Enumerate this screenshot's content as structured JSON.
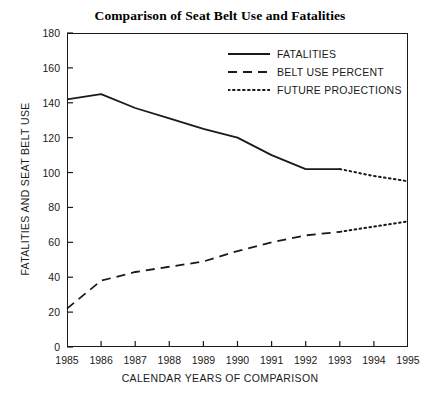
{
  "chart_data": {
    "type": "line",
    "title": "Comparison of Seat Belt Use and Fatalities",
    "xlabel": "CALENDAR YEARS OF COMPARISON",
    "ylabel": "FATALITIES AND SEAT BELT USE",
    "grid": false,
    "legend_position": "top-right",
    "x": [
      1985,
      1986,
      1987,
      1988,
      1989,
      1990,
      1991,
      1992,
      1993,
      1994,
      1995
    ],
    "xlim": [
      1985,
      1995
    ],
    "ylim": [
      0,
      180
    ],
    "xticks": [
      "1985",
      "1986",
      "1987",
      "1988",
      "1989",
      "1990",
      "1991",
      "1992",
      "1993",
      "1994",
      "1995"
    ],
    "yticks": [
      "0",
      "20",
      "40",
      "60",
      "80",
      "100",
      "120",
      "140",
      "160",
      "180"
    ],
    "series": [
      {
        "name": "FATALITIES",
        "style": "solid",
        "color": "#1a1a1a",
        "x": [
          1985,
          1986,
          1987,
          1988,
          1989,
          1990,
          1991,
          1992,
          1993
        ],
        "values": [
          142,
          145,
          137,
          131,
          125,
          120,
          110,
          102,
          102
        ]
      },
      {
        "name": "BELT USE PERCENT",
        "style": "dashed",
        "color": "#1a1a1a",
        "x": [
          1985,
          1986,
          1987,
          1988,
          1989,
          1990,
          1991,
          1992,
          1993
        ],
        "values": [
          22,
          38,
          43,
          46,
          49,
          55,
          60,
          64,
          66
        ]
      },
      {
        "name": "FUTURE PROJECTIONS",
        "style": "dotted",
        "color": "#1a1a1a",
        "segments": [
          {
            "x": [
              1993,
              1994,
              1995
            ],
            "values": [
              102,
              98,
              95
            ]
          },
          {
            "x": [
              1993,
              1994,
              1995
            ],
            "values": [
              66,
              69,
              72
            ]
          }
        ]
      }
    ],
    "legend": [
      "FATALITIES",
      "BELT USE PERCENT",
      "FUTURE PROJECTIONS"
    ]
  }
}
